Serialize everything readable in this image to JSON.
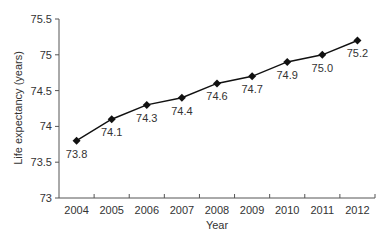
{
  "chart_data": {
    "type": "line",
    "title": "",
    "xlabel": "Year",
    "ylabel": "Life expectancy (years)",
    "categories": [
      "2004",
      "2005",
      "2006",
      "2007",
      "2008",
      "2009",
      "2010",
      "2011",
      "2012"
    ],
    "series": [
      {
        "name": "Life expectancy",
        "values": [
          73.8,
          74.1,
          74.3,
          74.4,
          74.6,
          74.7,
          74.9,
          75.0,
          75.2
        ],
        "data_labels": [
          "73.8",
          "74.1",
          "74.3",
          "74.4",
          "74.6",
          "74.7",
          "74.9",
          "75.0",
          "75.2"
        ],
        "marker": "diamond",
        "color": "#111111"
      }
    ],
    "ylim": [
      73,
      75.5
    ],
    "yticks": [
      73,
      73.5,
      74,
      74.5,
      75,
      75.5
    ],
    "ytick_labels": [
      "73",
      "73.5",
      "74",
      "74.5",
      "75",
      "75.5"
    ],
    "grid": false,
    "legend": null
  },
  "layout": {
    "plot_left": 59,
    "plot_right": 375,
    "plot_top": 19,
    "plot_bottom": 198
  }
}
